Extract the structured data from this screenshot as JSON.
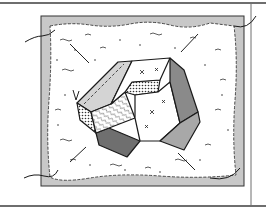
{
  "illustration": {
    "subject": "crazy-quilt block clipart",
    "colors": {
      "background": "#ffffff",
      "frame_line": "#6e6e6e",
      "border_fill": "#c8c8c8",
      "field_fill": "#ffffff",
      "ink": "#1a1a1a",
      "patch_light": "#d4d4d4",
      "patch_mid": "#9a9a9a",
      "patch_dark": "#6f6f6f"
    }
  }
}
